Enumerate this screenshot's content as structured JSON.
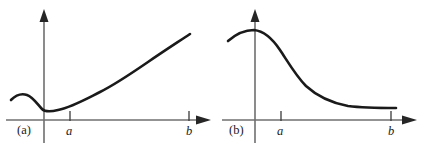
{
  "figure": {
    "background_color": "#ffffff",
    "curve_color": "#1a1a1a",
    "axis_color": "#6f6f6f",
    "width": 435,
    "height": 148
  },
  "panels": [
    {
      "id": "a",
      "panel_label": "(a)",
      "tick_labels": {
        "a": "a",
        "b": "b"
      },
      "chart_data": {
        "type": "line",
        "title": "",
        "xlabel": "",
        "ylabel": "",
        "grid": false,
        "legend": null,
        "axes": {
          "x_axis": {
            "visible": true,
            "arrow": "right",
            "y_pixel": 120
          },
          "y_axis": {
            "visible": true,
            "arrow": "up",
            "x_pixel": 44
          }
        },
        "ticks": [
          {
            "label": "a",
            "x_pixel": 70
          },
          {
            "label": "b",
            "x_pixel": 189
          }
        ],
        "description": "Curve with a local maximum left of the y-axis, a local minimum just right of the origin, then increasing convexly to b",
        "x": [
          11,
          17,
          23,
          29,
          35,
          41,
          44,
          50,
          58,
          70,
          85,
          100,
          115,
          130,
          145,
          160,
          175,
          190
        ],
        "y_pixel": [
          100,
          96,
          94,
          96,
          102,
          108,
          110,
          111,
          110,
          106,
          100,
          93,
          85,
          76,
          66,
          55,
          45,
          35
        ],
        "curve_path": "M 11,100 C 16,95 21,93 27,95 C 33,97 38,105 42,109 C 45,112 50,112 58,110 C 72,107 86,99 100,92 C 116,84 132,73 148,62 C 164,51 178,42 190,34"
      }
    },
    {
      "id": "b",
      "panel_label": "(b)",
      "tick_labels": {
        "a": "a",
        "b": "b"
      },
      "chart_data": {
        "type": "line",
        "title": "",
        "xlabel": "",
        "ylabel": "",
        "grid": false,
        "legend": null,
        "axes": {
          "x_axis": {
            "visible": true,
            "arrow": "right",
            "y_pixel": 120
          },
          "y_axis": {
            "visible": true,
            "arrow": "up",
            "x_pixel": 37
          }
        },
        "ticks": [
          {
            "label": "a",
            "x_pixel": 63
          },
          {
            "label": "b",
            "x_pixel": 173
          }
        ],
        "description": "Sigmoid-shaped decreasing curve peaking just right of the y-axis and flattening out toward b",
        "x": [
          10,
          20,
          30,
          37,
          45,
          55,
          65,
          75,
          85,
          95,
          105,
          115,
          125,
          135,
          145,
          155,
          165,
          178
        ],
        "y_pixel": [
          40,
          35,
          32,
          31,
          32,
          37,
          45,
          55,
          66,
          76,
          85,
          92,
          97,
          101,
          104,
          106,
          107,
          108
        ],
        "curve_path": "M 10,41 C 18,34 27,30 36,30 C 46,31 54,38 62,50 C 70,62 78,76 88,86 C 100,97 114,103 130,106 C 146,108 162,108 178,108"
      }
    }
  ]
}
